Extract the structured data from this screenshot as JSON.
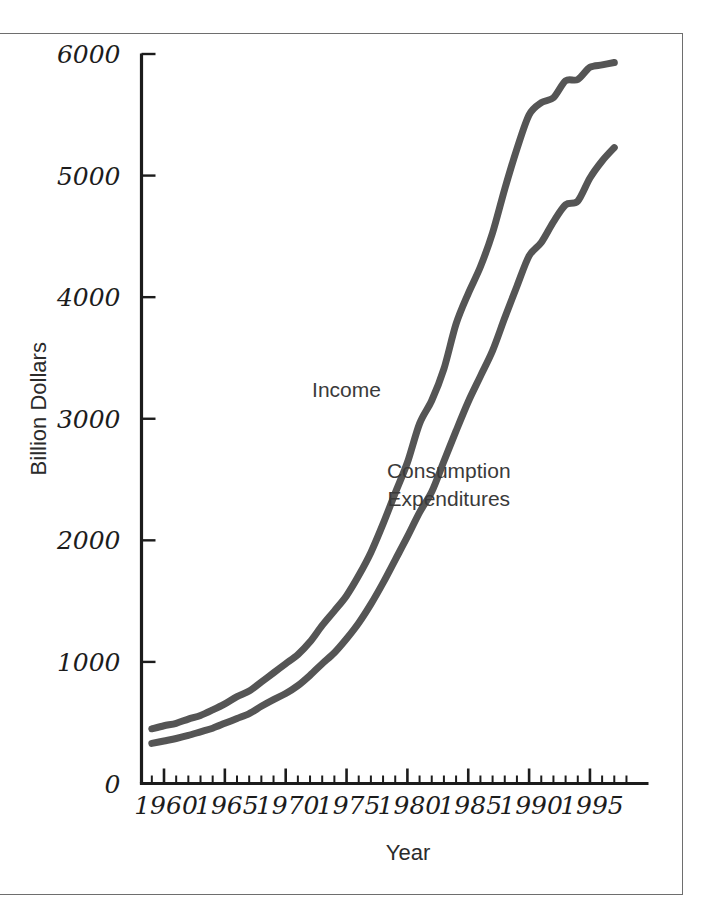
{
  "figure": {
    "background": "#ffffff",
    "frame_color": "#6e6e6e",
    "axis_color": "#1c1c1c"
  },
  "chart_data": {
    "type": "line",
    "title": "",
    "subtitle": "",
    "xlabel": "Year",
    "ylabel": "Billion Dollars",
    "xlim": [
      1959,
      1998
    ],
    "ylim": [
      0,
      6000
    ],
    "xticks": [
      1960,
      1965,
      1970,
      1975,
      1980,
      1985,
      1990,
      1995
    ],
    "xtick_labels": [
      "1960",
      "1965",
      "1970",
      "1975",
      "1980",
      "1985",
      "1990",
      "1995"
    ],
    "xminor_tick_interval": 1,
    "yticks": [
      0,
      1000,
      2000,
      3000,
      4000,
      5000,
      6000
    ],
    "ytick_labels": [
      "0",
      "1000",
      "2000",
      "3000",
      "4000",
      "5000",
      "6000"
    ],
    "grid": false,
    "legend": "inline-annotations",
    "line_color": "#555555",
    "line_width": 7,
    "x": [
      1959,
      1960,
      1961,
      1962,
      1963,
      1964,
      1965,
      1966,
      1967,
      1968,
      1969,
      1970,
      1971,
      1972,
      1973,
      1974,
      1975,
      1976,
      1977,
      1978,
      1979,
      1980,
      1981,
      1982,
      1983,
      1984,
      1985,
      1986,
      1987,
      1988,
      1989,
      1990,
      1991,
      1992,
      1993,
      1994,
      1995,
      1996,
      1997
    ],
    "series": [
      {
        "name": "Income",
        "label": "Income",
        "color": "#555555",
        "label_x": 1975.0,
        "label_y": 3180,
        "values": [
          450,
          475,
          495,
          530,
          560,
          605,
          655,
          715,
          760,
          835,
          910,
          985,
          1060,
          1165,
          1300,
          1420,
          1545,
          1710,
          1900,
          2135,
          2390,
          2640,
          2960,
          3150,
          3410,
          3780,
          4030,
          4250,
          4530,
          4890,
          5220,
          5500,
          5600,
          5640,
          5780,
          5790,
          5890,
          5910,
          5930
        ]
      },
      {
        "name": "Consumption Expenditures",
        "label": "Consumption\nExpenditures",
        "label_line1": "Consumption",
        "label_line2": "Expenditures",
        "color": "#555555",
        "label_x": 1983.4,
        "label_y": 2610,
        "values": [
          330,
          350,
          370,
          395,
          425,
          455,
          495,
          535,
          575,
          635,
          690,
          740,
          805,
          890,
          985,
          1075,
          1190,
          1320,
          1475,
          1650,
          1840,
          2030,
          2230,
          2400,
          2650,
          2900,
          3140,
          3350,
          3560,
          3830,
          4090,
          4340,
          4450,
          4620,
          4760,
          4790,
          4980,
          5120,
          5230
        ]
      }
    ],
    "annotations": [
      {
        "text": "Income",
        "x": 1975.0,
        "y": 3180
      },
      {
        "text": "Consumption",
        "x": 1983.4,
        "y": 2700
      },
      {
        "text": "Expenditures",
        "x": 1983.4,
        "y": 2510
      }
    ]
  }
}
